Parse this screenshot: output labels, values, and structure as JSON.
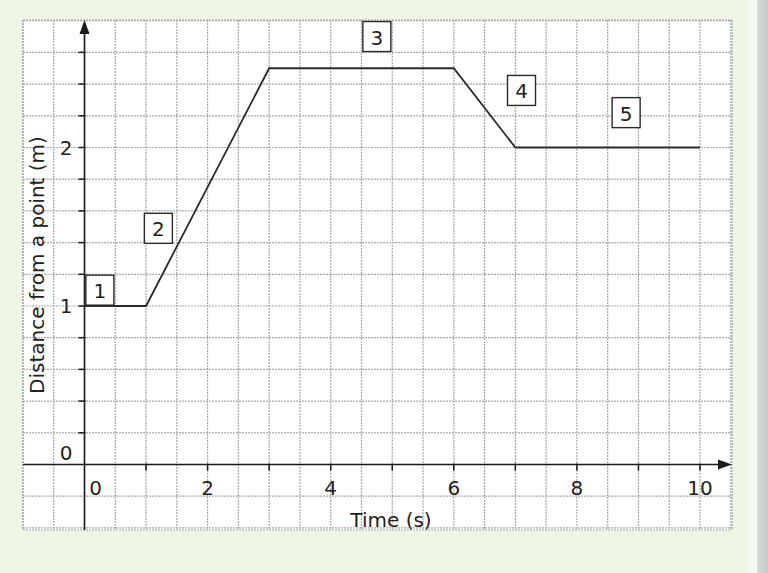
{
  "chart_data": {
    "type": "line",
    "title": "",
    "xlabel": "Time (s)",
    "ylabel": "Distance from a point (m)",
    "xlim": [
      -2,
      10.5
    ],
    "ylim": [
      -0.4,
      2.8
    ],
    "grid": true,
    "x_ticks": [
      0,
      2,
      4,
      6,
      8,
      10
    ],
    "x_tick_labels": [
      "0",
      "2",
      "4",
      "6",
      "8",
      "10"
    ],
    "y_ticks": [
      0,
      1,
      2
    ],
    "y_tick_labels": [
      "0",
      "1",
      "2"
    ],
    "x_minor_step": 0.5,
    "y_minor_step": 0.2,
    "series": [
      {
        "name": "distance-time",
        "x": [
          0,
          1,
          3,
          6,
          7,
          10
        ],
        "y": [
          1,
          1,
          2.5,
          2.5,
          2,
          2
        ]
      }
    ],
    "annotations": [
      {
        "label": "1",
        "x": 0.25,
        "y": 1.1,
        "segment": "0–1 s, stationary at 1 m"
      },
      {
        "label": "2",
        "x": 1.2,
        "y": 1.49,
        "segment": "1–3 s, moving away to 2.5 m"
      },
      {
        "label": "3",
        "x": 4.75,
        "y": 2.7,
        "segment": "3–6 s, stationary at 2.5 m"
      },
      {
        "label": "4",
        "x": 7.1,
        "y": 2.36,
        "segment": "6–7 s, moving back to 2 m"
      },
      {
        "label": "5",
        "x": 8.8,
        "y": 2.22,
        "segment": "7–10 s, stationary at 2 m"
      }
    ],
    "legend": null
  },
  "labels": {
    "x_axis_title": "Time (s)",
    "y_axis_title": "Distance from a point (m)",
    "x_ticks": [
      "0",
      "2",
      "4",
      "6",
      "8",
      "10"
    ],
    "y_ticks": [
      "0",
      "1",
      "2"
    ],
    "segments": [
      "1",
      "2",
      "3",
      "4",
      "5"
    ]
  },
  "colors": {
    "background": "#eef7e6",
    "grid_fill": "#ffffff",
    "grid_line": "#a9a9a9",
    "axis": "#1a1a1a",
    "line": "#2a2a2a"
  }
}
